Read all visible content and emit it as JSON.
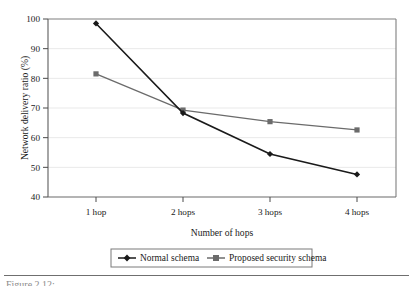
{
  "figure": {
    "background_color": "#ffffff",
    "plot_border_color": "#7a7a7a",
    "gridline_color": "#e6e6e6",
    "caption_partial": "Figure 2.12:"
  },
  "chart_data": {
    "type": "line",
    "title": "",
    "xlabel": "Number of hops",
    "ylabel": "Network delivery ratio (%)",
    "categories": [
      "1 hop",
      "2 hops",
      "3 hops",
      "4 hops"
    ],
    "ylim": [
      40,
      100
    ],
    "yticks": [
      40,
      50,
      60,
      70,
      80,
      90,
      100
    ],
    "ytick_labels": [
      "40",
      "50",
      "60",
      "70",
      "80",
      "90",
      "100"
    ],
    "grid": true,
    "grid_axis": "y",
    "legend_position": "below-axis",
    "series": [
      {
        "name": "Normal schema",
        "values": [
          98.5,
          68.3,
          54.5,
          47.6
        ],
        "color": "#1a1a1a",
        "marker": "diamond"
      },
      {
        "name": "Proposed security schema",
        "values": [
          81.5,
          69.3,
          65.4,
          62.6
        ],
        "color": "#6b6b6b",
        "marker": "square"
      }
    ]
  },
  "legend": {
    "entries": [
      {
        "label": "Normal schema",
        "marker": "diamond-marker",
        "color": "#1a1a1a"
      },
      {
        "label": "Proposed security schema",
        "marker": "square-marker",
        "color": "#6b6b6b"
      }
    ]
  }
}
